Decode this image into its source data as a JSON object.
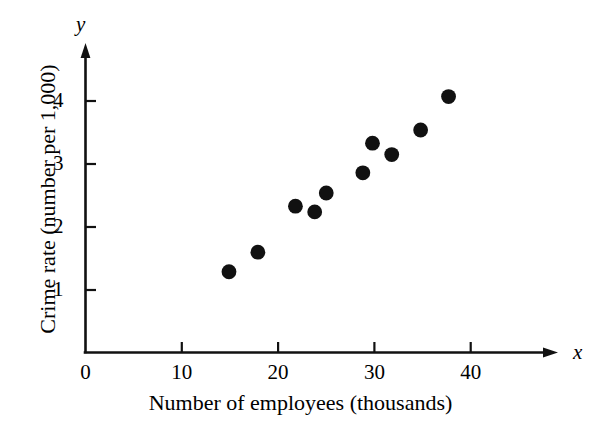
{
  "chart_data": {
    "type": "scatter",
    "title": "",
    "xlabel": "Number of employees (thousands)",
    "ylabel": "Crime rate (number per 1,000)",
    "x_axis_variable": "x",
    "y_axis_variable": "y",
    "xlim": [
      0,
      48
    ],
    "ylim": [
      0,
      4.7
    ],
    "xticks": [
      0,
      10,
      20,
      30,
      40
    ],
    "xtick_labels": [
      "0",
      "10",
      "20",
      "30",
      "40"
    ],
    "yticks": [
      1,
      2,
      3,
      4
    ],
    "ytick_labels": [
      "1",
      "2",
      "3",
      "4"
    ],
    "grid": false,
    "legend": null,
    "marker": "filled-circle",
    "marker_color": "#111111",
    "points": [
      {
        "x": 14.9,
        "y": 1.29
      },
      {
        "x": 17.9,
        "y": 1.6
      },
      {
        "x": 21.8,
        "y": 2.33
      },
      {
        "x": 23.8,
        "y": 2.24
      },
      {
        "x": 25.0,
        "y": 2.54
      },
      {
        "x": 28.8,
        "y": 2.86
      },
      {
        "x": 29.8,
        "y": 3.33
      },
      {
        "x": 31.8,
        "y": 3.15
      },
      {
        "x": 34.8,
        "y": 3.54
      },
      {
        "x": 37.7,
        "y": 4.07
      }
    ]
  }
}
